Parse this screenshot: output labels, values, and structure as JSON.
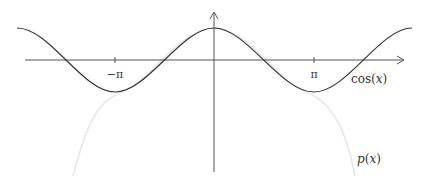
{
  "diagram": {
    "axes": {
      "x_axis": {
        "y": 60,
        "x_start": 25,
        "x_end": 405,
        "arrow": true
      },
      "y_axis": {
        "x": 214,
        "y_start": 172,
        "y_end": 12,
        "arrow": true
      }
    },
    "ticks": [
      {
        "label": "−π",
        "x": 115
      },
      {
        "label": "π",
        "x": 314
      }
    ],
    "curves": [
      {
        "name": "cos(x)",
        "label": "cos(x)",
        "color": "#333333"
      },
      {
        "name": "p(x)",
        "label": "p(x)",
        "color": "#e6e6e6"
      }
    ],
    "labels": {
      "cos": {
        "fn": "cos",
        "open": "(",
        "var": "x",
        "close": ")"
      },
      "p": {
        "fn": "p",
        "open": "(",
        "var": "x",
        "close": ")"
      }
    },
    "colors": {
      "axis": "#555555",
      "cos_curve": "#333333",
      "p_curve": "#e6e6e6",
      "text": "#333333"
    }
  }
}
